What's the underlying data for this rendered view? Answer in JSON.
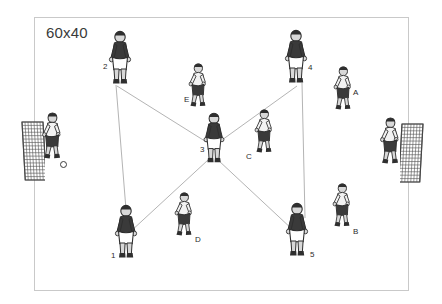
{
  "diagram": {
    "title": "60x40",
    "field": {
      "x": 34,
      "y": 17,
      "width": 375,
      "height": 274,
      "border_color": "#c9c9c9",
      "fill_color": "#ffffff"
    },
    "colors": {
      "dark_kit": "#3a3a3a",
      "light_kit": "#f2f2f2",
      "skin": "#d8d8d8",
      "line": "#b4b4b4",
      "label": "#2b2b2b",
      "net": "#555555"
    },
    "connector_lines": [
      {
        "name": "line-2-to-1",
        "x1": 116,
        "y1": 85,
        "x2": 127,
        "y2": 222
      },
      {
        "name": "line-4-to-5",
        "x1": 302,
        "y1": 83,
        "x2": 305,
        "y2": 218
      },
      {
        "name": "line-2-to-3",
        "x1": 117,
        "y1": 86,
        "x2": 208,
        "y2": 143
      },
      {
        "name": "line-4-to-3",
        "x1": 297,
        "y1": 86,
        "x2": 215,
        "y2": 145
      },
      {
        "name": "line-3-to-1",
        "x1": 208,
        "y1": 160,
        "x2": 130,
        "y2": 232
      },
      {
        "name": "line-3-to-5",
        "x1": 218,
        "y1": 160,
        "x2": 293,
        "y2": 230
      }
    ],
    "players": [
      {
        "id": "p2",
        "label": "2",
        "kit": "dark",
        "x": 120,
        "y": 58,
        "label_x": 103,
        "label_y": 62,
        "pose": "stand",
        "scale": 1.0
      },
      {
        "id": "p4",
        "label": "4",
        "kit": "dark",
        "x": 296,
        "y": 57,
        "label_x": 308,
        "label_y": 63,
        "pose": "stand",
        "scale": 1.0
      },
      {
        "id": "pE",
        "label": "E",
        "kit": "light",
        "x": 197,
        "y": 87,
        "label_x": 184,
        "label_y": 95,
        "pose": "crouch",
        "scale": 0.86
      },
      {
        "id": "pA",
        "label": "A",
        "kit": "light",
        "x": 342,
        "y": 90,
        "label_x": 353,
        "label_y": 88,
        "pose": "crouch",
        "scale": 0.86
      },
      {
        "id": "p3",
        "label": "3",
        "kit": "dark",
        "x": 214,
        "y": 138,
        "label_x": 200,
        "label_y": 145,
        "pose": "stand",
        "scale": 0.94
      },
      {
        "id": "pC",
        "label": "C",
        "kit": "light",
        "x": 263,
        "y": 133,
        "label_x": 246,
        "label_y": 152,
        "pose": "crouch",
        "scale": 0.86
      },
      {
        "id": "pD",
        "label": "D",
        "kit": "light",
        "x": 183,
        "y": 216,
        "label_x": 195,
        "label_y": 235,
        "pose": "crouch",
        "scale": 0.86
      },
      {
        "id": "pB",
        "label": "B",
        "kit": "light",
        "x": 341,
        "y": 207,
        "label_x": 353,
        "label_y": 227,
        "pose": "crouch",
        "scale": 0.86
      },
      {
        "id": "p1",
        "label": "1",
        "kit": "dark",
        "x": 126,
        "y": 232,
        "label_x": 111,
        "label_y": 251,
        "pose": "back",
        "scale": 1.0
      },
      {
        "id": "p5",
        "label": "5",
        "kit": "dark",
        "x": 297,
        "y": 230,
        "label_x": 310,
        "label_y": 250,
        "pose": "back",
        "scale": 1.0
      }
    ],
    "goalkeepers": [
      {
        "id": "gk-left",
        "kit": "light",
        "x": 51,
        "y": 138,
        "pose": "crouch",
        "scale": 0.92
      },
      {
        "id": "gk-right",
        "kit": "light",
        "x": 389,
        "y": 143,
        "pose": "crouch",
        "scale": 0.92
      }
    ],
    "goals": [
      {
        "id": "goal-left",
        "x": 20,
        "y": 120,
        "width": 21,
        "height": 58,
        "lean": "right"
      },
      {
        "id": "goal-right",
        "x": 400,
        "y": 122,
        "width": 21,
        "height": 58,
        "lean": "left"
      }
    ],
    "balls": [
      {
        "id": "ball-left",
        "x": 60,
        "y": 161
      }
    ]
  }
}
